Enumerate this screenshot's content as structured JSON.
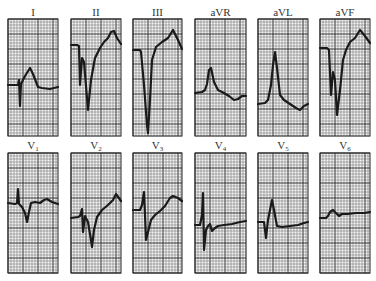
{
  "chart_data": {
    "type": "line",
    "grid": true,
    "grid_minor_px": 3,
    "grid_major_every": 5,
    "rows": [
      {
        "label_y": 16,
        "panel_top": 19,
        "panel_bottom": 136,
        "leads": [
          {
            "name": "I",
            "sub": "",
            "x0": 8,
            "x1": 58,
            "points": [
              [
                8,
                85
              ],
              [
                18,
                85
              ],
              [
                19,
                80
              ],
              [
                20,
                106
              ],
              [
                21,
                84
              ],
              [
                25,
                76
              ],
              [
                30,
                68
              ],
              [
                33,
                74
              ],
              [
                38,
                87
              ],
              [
                42,
                88
              ],
              [
                50,
                89
              ],
              [
                58,
                87
              ]
            ]
          },
          {
            "name": "II",
            "sub": "",
            "x0": 71,
            "x1": 121,
            "points": [
              [
                71,
                45
              ],
              [
                77,
                45
              ],
              [
                79,
                46
              ],
              [
                80,
                85
              ],
              [
                82,
                58
              ],
              [
                84,
                62
              ],
              [
                88,
                110
              ],
              [
                91,
                80
              ],
              [
                95,
                58
              ],
              [
                100,
                48
              ],
              [
                104,
                42
              ],
              [
                108,
                38
              ],
              [
                111,
                32
              ],
              [
                114,
                31
              ],
              [
                117,
                38
              ],
              [
                121,
                44
              ]
            ]
          },
          {
            "name": "III",
            "sub": "",
            "x0": 133,
            "x1": 182,
            "points": [
              [
                133,
                50
              ],
              [
                140,
                50
              ],
              [
                141,
                52
              ],
              [
                144,
                85
              ],
              [
                147,
                125
              ],
              [
                148,
                133
              ],
              [
                150,
                100
              ],
              [
                152,
                60
              ],
              [
                156,
                47
              ],
              [
                162,
                42
              ],
              [
                168,
                38
              ],
              [
                173,
                30
              ],
              [
                178,
                40
              ],
              [
                182,
                49
              ]
            ]
          },
          {
            "name": "aVR",
            "sub": "",
            "x0": 195,
            "x1": 246,
            "points": [
              [
                195,
                93
              ],
              [
                202,
                92
              ],
              [
                205,
                90
              ],
              [
                207,
                84
              ],
              [
                209,
                70
              ],
              [
                211,
                68
              ],
              [
                214,
                82
              ],
              [
                218,
                90
              ],
              [
                224,
                93
              ],
              [
                229,
                96
              ],
              [
                234,
                100
              ],
              [
                238,
                99
              ],
              [
                242,
                96
              ],
              [
                246,
                96
              ]
            ]
          },
          {
            "name": "aVL",
            "sub": "",
            "x0": 258,
            "x1": 308,
            "points": [
              [
                258,
                104
              ],
              [
                265,
                103
              ],
              [
                268,
                100
              ],
              [
                271,
                85
              ],
              [
                273,
                65
              ],
              [
                275,
                52
              ],
              [
                277,
                68
              ],
              [
                280,
                95
              ],
              [
                284,
                100
              ],
              [
                290,
                104
              ],
              [
                296,
                108
              ],
              [
                300,
                110
              ],
              [
                304,
                106
              ],
              [
                308,
                104
              ]
            ]
          },
          {
            "name": "aVF",
            "sub": "",
            "x0": 320,
            "x1": 370,
            "points": [
              [
                320,
                48
              ],
              [
                327,
                48
              ],
              [
                329,
                50
              ],
              [
                331,
                95
              ],
              [
                333,
                72
              ],
              [
                335,
                80
              ],
              [
                337,
                115
              ],
              [
                340,
                90
              ],
              [
                343,
                60
              ],
              [
                346,
                50
              ],
              [
                350,
                42
              ],
              [
                355,
                38
              ],
              [
                360,
                30
              ],
              [
                365,
                36
              ],
              [
                370,
                43
              ]
            ]
          }
        ]
      },
      {
        "label_y": 149,
        "panel_top": 153,
        "panel_bottom": 273,
        "leads": [
          {
            "name": "V",
            "sub": "1",
            "x0": 8,
            "x1": 58,
            "points": [
              [
                8,
                203
              ],
              [
                15,
                204
              ],
              [
                17,
                203
              ],
              [
                18,
                189
              ],
              [
                19,
                204
              ],
              [
                22,
                207
              ],
              [
                25,
                213
              ],
              [
                27,
                222
              ],
              [
                29,
                212
              ],
              [
                31,
                203
              ],
              [
                35,
                202
              ],
              [
                40,
                203
              ],
              [
                44,
                200
              ],
              [
                47,
                199
              ],
              [
                52,
                202
              ],
              [
                58,
                204
              ]
            ]
          },
          {
            "name": "V",
            "sub": "2",
            "x0": 71,
            "x1": 121,
            "points": [
              [
                71,
                218
              ],
              [
                78,
                217
              ],
              [
                80,
                216
              ],
              [
                82,
                209
              ],
              [
                83,
                232
              ],
              [
                85,
                216
              ],
              [
                88,
                222
              ],
              [
                91,
                240
              ],
              [
                92,
                247
              ],
              [
                94,
                230
              ],
              [
                97,
                217
              ],
              [
                102,
                210
              ],
              [
                108,
                205
              ],
              [
                113,
                200
              ],
              [
                116,
                194
              ],
              [
                121,
                201
              ]
            ]
          },
          {
            "name": "V",
            "sub": "3",
            "x0": 133,
            "x1": 182,
            "points": [
              [
                133,
                210
              ],
              [
                140,
                210
              ],
              [
                142,
                205
              ],
              [
                144,
                192
              ],
              [
                145,
                215
              ],
              [
                146,
                240
              ],
              [
                148,
                232
              ],
              [
                151,
                220
              ],
              [
                155,
                215
              ],
              [
                160,
                211
              ],
              [
                165,
                206
              ],
              [
                170,
                198
              ],
              [
                173,
                196
              ],
              [
                178,
                198
              ],
              [
                182,
                201
              ]
            ]
          },
          {
            "name": "V",
            "sub": "4",
            "x0": 195,
            "x1": 246,
            "points": [
              [
                195,
                225
              ],
              [
                200,
                225
              ],
              [
                202,
                215
              ],
              [
                203,
                193
              ],
              [
                204,
                250
              ],
              [
                206,
                230
              ],
              [
                208,
                226
              ],
              [
                210,
                224
              ],
              [
                212,
                231
              ],
              [
                215,
                228
              ],
              [
                218,
                226
              ],
              [
                224,
                225
              ],
              [
                232,
                224
              ],
              [
                240,
                222
              ],
              [
                246,
                221
              ]
            ]
          },
          {
            "name": "V",
            "sub": "5",
            "x0": 258,
            "x1": 308,
            "points": [
              [
                258,
                222
              ],
              [
                264,
                222
              ],
              [
                266,
                238
              ],
              [
                268,
                220
              ],
              [
                271,
                205
              ],
              [
                272,
                200
              ],
              [
                274,
                210
              ],
              [
                277,
                226
              ],
              [
                282,
                227
              ],
              [
                290,
                226
              ],
              [
                298,
                225
              ],
              [
                304,
                223
              ],
              [
                308,
                222
              ]
            ]
          },
          {
            "name": "V",
            "sub": "6",
            "x0": 320,
            "x1": 370,
            "points": [
              [
                320,
                218
              ],
              [
                326,
                218
              ],
              [
                328,
                216
              ],
              [
                330,
                212
              ],
              [
                333,
                210
              ],
              [
                336,
                213
              ],
              [
                339,
                216
              ],
              [
                342,
                214
              ],
              [
                348,
                214
              ],
              [
                356,
                213
              ],
              [
                364,
                213
              ],
              [
                370,
                212
              ]
            ]
          }
        ]
      }
    ]
  },
  "labels": {
    "I": "I",
    "II": "II",
    "III": "III",
    "aVR": "aVR",
    "aVL": "aVL",
    "aVF": "aVF",
    "V1": "V1",
    "V2": "V2",
    "V3": "V3",
    "V4": "V4",
    "V5": "V5",
    "V6": "V6"
  }
}
